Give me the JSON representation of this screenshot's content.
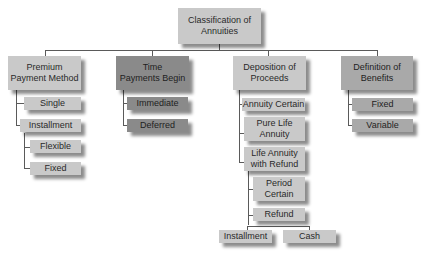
{
  "diagram": {
    "root": {
      "line1": "Classification of",
      "line2": "Annuities"
    },
    "categories": [
      {
        "line1": "Premium",
        "line2": "Payment Method",
        "children": [
          "Single",
          "Installment"
        ],
        "grandchildren": [
          "Flexible",
          "Fixed"
        ]
      },
      {
        "line1": "Time",
        "line2": "Payments Begin",
        "children": [
          "Immediate",
          "Deferred"
        ]
      },
      {
        "line1": "Deposition of",
        "line2": "Proceeds",
        "children": [
          "Annuity Certain",
          {
            "line1": "Pure Life",
            "line2": "Annuity"
          },
          {
            "line1": "Life Annuity",
            "line2": "with Refund"
          }
        ],
        "grandchildren": [
          {
            "line1": "Period",
            "line2": "Certain"
          },
          "Refund"
        ],
        "great_grandchildren": [
          "Installment",
          "Cash"
        ]
      },
      {
        "line1": "Definition of",
        "line2": "Benefits",
        "children": [
          "Fixed",
          "Variable"
        ]
      }
    ],
    "colors": {
      "light": "#c9c9c9",
      "mid": "#a9a9a9",
      "dark": "#8a8a8a",
      "line": "#5a5a5a"
    }
  }
}
